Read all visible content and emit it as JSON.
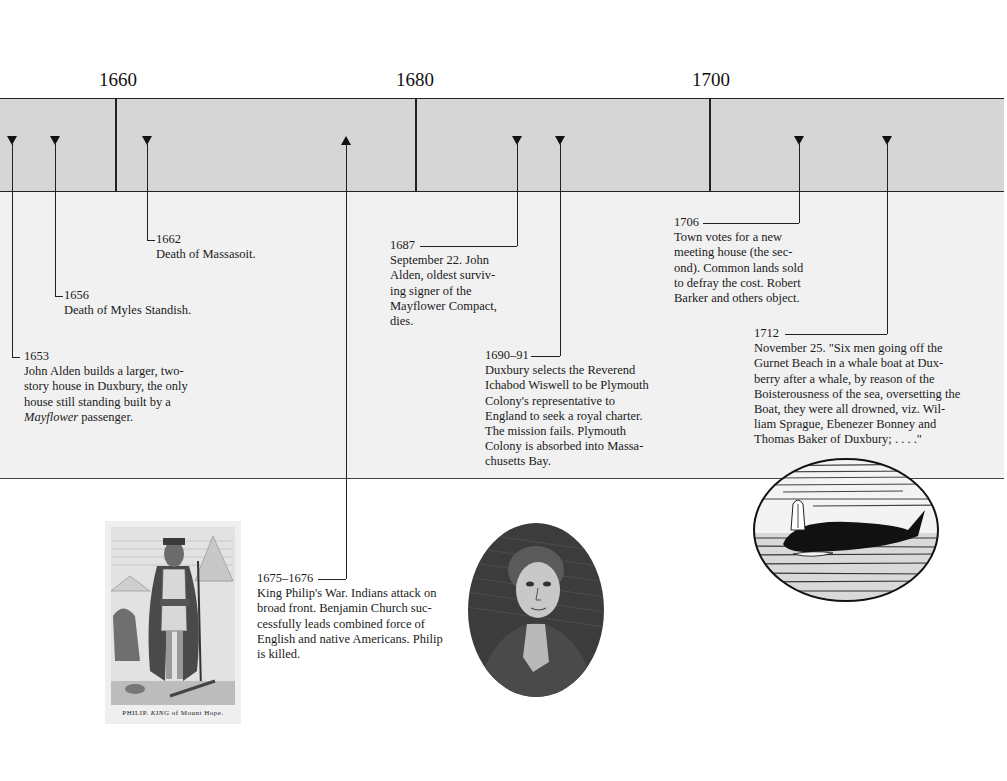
{
  "timeline": {
    "year_labels": [
      {
        "label": "1660",
        "x": 118
      },
      {
        "label": "1680",
        "x": 415
      },
      {
        "label": "1700",
        "x": 711
      }
    ],
    "band_color": "#d6d6d6",
    "panel_color": "#f1f1f1"
  },
  "events": [
    {
      "year": "1653",
      "lines": [
        "John Alden builds a larger, two-",
        "story house in Duxbury, the only",
        "house still standing built by a"
      ],
      "last_italic": "Mayflower",
      "last_rest": " passenger."
    },
    {
      "year": "1656",
      "text": "Death of Myles Standish."
    },
    {
      "year": "1662",
      "text": "Death of Massasoit."
    },
    {
      "year": "1675–1676",
      "lines": [
        "King Philip's War. Indians attack on",
        "broad front. Benjamin Church suc-",
        "cessfully leads combined force of",
        "English and native Americans. Philip",
        "is killed."
      ]
    },
    {
      "year": "1687",
      "lines": [
        "September 22. John",
        "Alden, oldest surviv-",
        "ing signer of the",
        "Mayflower Compact,",
        "dies."
      ]
    },
    {
      "year": "1690–91",
      "lines": [
        "Duxbury selects the Reverend",
        "Ichabod Wiswell to be Plymouth",
        "Colony's representative to",
        "England to seek a royal charter.",
        "The mission fails. Plymouth",
        "Colony is absorbed into Massa-",
        "chusetts Bay."
      ]
    },
    {
      "year": "1706",
      "lines": [
        "Town votes for a new",
        "meeting house (the sec-",
        "ond). Common lands sold",
        "to defray the cost. Robert",
        "Barker and others object."
      ]
    },
    {
      "year": "1712",
      "lines": [
        "November 25. \"Six men going off the",
        "Gurnet Beach in a whale boat at Dux-",
        "berry after a whale, by reason of the",
        "Boisterousness of the sea, oversetting the",
        "Boat, they were all drowned, viz. Wil-",
        "liam Sprague, Ebenezer Bonney and",
        "Thomas Baker of Duxbury; . . . .\""
      ]
    }
  ],
  "illustrations": {
    "philip": {
      "caption_a": "PHILIP.",
      "caption_b": "KING",
      "caption_c": "of Mount Hope."
    },
    "portrait": {
      "subject": "oval engraved portrait"
    },
    "whale": {
      "subject": "oval engraving of whale spouting"
    }
  }
}
